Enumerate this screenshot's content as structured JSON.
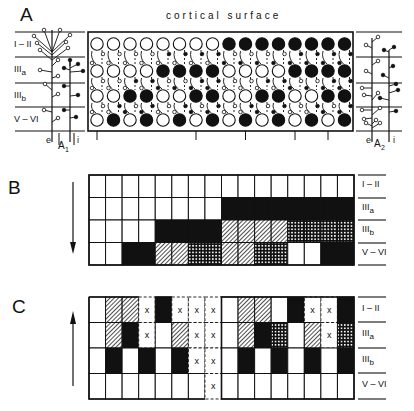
{
  "figure": {
    "panels": [
      {
        "id": "A",
        "label": "A",
        "caption": "cortical surface",
        "layers": [
          "I–II",
          "IIIa",
          "IIIb",
          "V–VI"
        ],
        "layer_labels": [
          {
            "main": "I – II",
            "sub": ""
          },
          {
            "main": "III",
            "sub": "a"
          },
          {
            "main": "III",
            "sub": "b"
          },
          {
            "main": "V – VI",
            "sub": ""
          }
        ],
        "left_neuron_label": {
          "main": "A",
          "sub": "1"
        },
        "right_neuron_label": {
          "main": "A",
          "sub": "2"
        },
        "axon_labels": {
          "excitatory": "e",
          "inhibitory": "i"
        },
        "columns": 16,
        "cell_states_legend": {
          "F": "filled (active)",
          "O": "open (inactive)"
        },
        "cells": [
          [
            "O",
            "O",
            "O",
            "O",
            "O",
            "O",
            "O",
            "O",
            "F",
            "F",
            "F",
            "F",
            "F",
            "F",
            "F",
            "F"
          ],
          [
            "O",
            "O",
            "O",
            "O",
            "F",
            "F",
            "F",
            "F",
            "O",
            "O",
            "O",
            "O",
            "F",
            "F",
            "F",
            "F"
          ],
          [
            "O",
            "O",
            "F",
            "F",
            "O",
            "O",
            "F",
            "F",
            "O",
            "O",
            "F",
            "F",
            "O",
            "O",
            "F",
            "F"
          ],
          [
            "O",
            "F",
            "O",
            "F",
            "O",
            "F",
            "O",
            "F",
            "O",
            "F",
            "O",
            "F",
            "O",
            "F",
            "O",
            "F"
          ]
        ]
      },
      {
        "id": "B",
        "label": "B",
        "arrow": "down",
        "layer_labels": [
          {
            "main": "I – II",
            "sub": ""
          },
          {
            "main": "III",
            "sub": "a"
          },
          {
            "main": "III",
            "sub": "b"
          },
          {
            "main": "V – VI",
            "sub": ""
          }
        ],
        "fill_legend": {
          "W": "white",
          "B": "black",
          "H": "hatched",
          "D": "dotted"
        },
        "cells": [
          [
            "W",
            "W",
            "W",
            "W",
            "W",
            "W",
            "W",
            "W",
            "W",
            "W",
            "W",
            "W",
            "W",
            "W",
            "W",
            "W"
          ],
          [
            "W",
            "W",
            "W",
            "W",
            "W",
            "W",
            "W",
            "W",
            "B",
            "B",
            "B",
            "B",
            "B",
            "B",
            "B",
            "B"
          ],
          [
            "W",
            "W",
            "W",
            "W",
            "B",
            "B",
            "B",
            "B",
            "H",
            "H",
            "H",
            "H",
            "D",
            "D",
            "D",
            "D"
          ],
          [
            "W",
            "W",
            "B",
            "B",
            "H",
            "H",
            "D",
            "D",
            "H",
            "H",
            "D",
            "D",
            "W",
            "W",
            "B",
            "B"
          ]
        ]
      },
      {
        "id": "C",
        "label": "C",
        "arrow": "up",
        "marker": "x",
        "layer_labels": [
          {
            "main": "I – II",
            "sub": ""
          },
          {
            "main": "III",
            "sub": "a"
          },
          {
            "main": "III",
            "sub": "b"
          },
          {
            "main": "V – VI",
            "sub": ""
          }
        ],
        "fill_legend": {
          "W": "white",
          "B": "black",
          "H": "hatched",
          "D": "dotted",
          "X": "eliminated (x, dashed)"
        },
        "cells": [
          [
            "W",
            "H",
            "H",
            "X",
            "B",
            "X",
            "X",
            "X",
            "W",
            "H",
            "H",
            "W",
            "B",
            "X",
            "X",
            "B"
          ],
          [
            "W",
            "H",
            "B",
            "X",
            "W",
            "H",
            "X",
            "X",
            "W",
            "H",
            "B",
            "D",
            "W",
            "H",
            "X",
            "D"
          ],
          [
            "W",
            "B",
            "W",
            "B",
            "W",
            "B",
            "X",
            "X",
            "W",
            "B",
            "W",
            "B",
            "W",
            "B",
            "W",
            "B"
          ],
          [
            "W",
            "W",
            "W",
            "W",
            "W",
            "W",
            "W",
            "X",
            "W",
            "W",
            "W",
            "W",
            "W",
            "W",
            "W",
            "W"
          ]
        ]
      }
    ]
  }
}
